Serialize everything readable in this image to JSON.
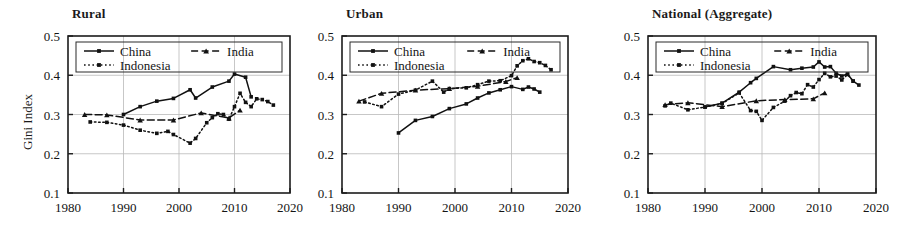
{
  "figure": {
    "ylabel": "Gini Index",
    "panels": [
      "Rural",
      "Urban",
      "National (Aggregate)"
    ]
  },
  "chart_data": [
    {
      "type": "line",
      "title": "Rural",
      "xlabel": "",
      "ylabel": "Gini Index",
      "xlim": [
        1980,
        2020
      ],
      "ylim": [
        0.1,
        0.5
      ],
      "xticks": [
        1980,
        1990,
        2000,
        2010,
        2020
      ],
      "yticks": [
        0.1,
        0.2,
        0.3,
        0.4,
        0.5
      ],
      "grid": true,
      "legend_position": "top-left",
      "series": [
        {
          "name": "China",
          "style": "solid",
          "marker": "square",
          "x": [
            1990,
            1993,
            1996,
            1999,
            2002,
            2003,
            2006,
            2009,
            2010,
            2012,
            2013
          ],
          "y": [
            0.3,
            0.32,
            0.334,
            0.341,
            0.363,
            0.342,
            0.37,
            0.385,
            0.403,
            0.395,
            0.345
          ]
        },
        {
          "name": "India",
          "style": "dashed",
          "marker": "triangle",
          "x": [
            1983,
            1987,
            1993,
            1999,
            2004,
            2009,
            2011
          ],
          "y": [
            0.3,
            0.299,
            0.286,
            0.286,
            0.304,
            0.291,
            0.311
          ]
        },
        {
          "name": "Indonesia",
          "style": "dotted",
          "marker": "square",
          "x": [
            1984,
            1987,
            1990,
            1993,
            1996,
            1998,
            1999,
            2002,
            2003,
            2005,
            2006,
            2007,
            2008,
            2009,
            2010,
            2011,
            2012,
            2013,
            2014,
            2015,
            2016,
            2017
          ],
          "y": [
            0.281,
            0.28,
            0.273,
            0.26,
            0.252,
            0.257,
            0.249,
            0.227,
            0.239,
            0.279,
            0.292,
            0.302,
            0.3,
            0.288,
            0.32,
            0.354,
            0.331,
            0.32,
            0.34,
            0.338,
            0.333,
            0.324
          ]
        }
      ]
    },
    {
      "type": "line",
      "title": "Urban",
      "xlabel": "",
      "ylabel": "",
      "xlim": [
        1980,
        2020
      ],
      "ylim": [
        0.1,
        0.5
      ],
      "xticks": [
        1980,
        1990,
        2000,
        2010,
        2020
      ],
      "yticks": [
        0.1,
        0.2,
        0.3,
        0.4,
        0.5
      ],
      "grid": true,
      "legend_position": "top-left",
      "series": [
        {
          "name": "China",
          "style": "solid",
          "marker": "square",
          "x": [
            1990,
            1993,
            1996,
            1999,
            2002,
            2004,
            2006,
            2008,
            2010,
            2012,
            2013,
            2014,
            2015
          ],
          "y": [
            0.253,
            0.285,
            0.295,
            0.315,
            0.327,
            0.342,
            0.355,
            0.363,
            0.371,
            0.364,
            0.37,
            0.365,
            0.357
          ]
        },
        {
          "name": "India",
          "style": "dashed",
          "marker": "triangle",
          "x": [
            1983,
            1987,
            1993,
            1999,
            2004,
            2009,
            2011
          ],
          "y": [
            0.334,
            0.354,
            0.362,
            0.366,
            0.372,
            0.384,
            0.394
          ]
        },
        {
          "name": "Indonesia",
          "style": "dotted",
          "marker": "square",
          "x": [
            1984,
            1987,
            1990,
            1993,
            1996,
            1998,
            1999,
            2002,
            2004,
            2006,
            2008,
            2010,
            2011,
            2012,
            2013,
            2014,
            2015,
            2016,
            2017
          ],
          "y": [
            0.332,
            0.32,
            0.352,
            0.362,
            0.385,
            0.357,
            0.366,
            0.368,
            0.376,
            0.385,
            0.386,
            0.399,
            0.424,
            0.437,
            0.442,
            0.435,
            0.432,
            0.425,
            0.414
          ]
        }
      ]
    },
    {
      "type": "line",
      "title": "National (Aggregate)",
      "xlabel": "",
      "ylabel": "",
      "xlim": [
        1980,
        2020
      ],
      "ylim": [
        0.1,
        0.5
      ],
      "xticks": [
        1980,
        1990,
        2000,
        2010,
        2020
      ],
      "yticks": [
        0.1,
        0.2,
        0.3,
        0.4,
        0.5
      ],
      "grid": true,
      "legend_position": "top-left",
      "series": [
        {
          "name": "China",
          "style": "solid",
          "marker": "square",
          "x": [
            1990,
            1993,
            1996,
            1998,
            1999,
            2002,
            2005,
            2007,
            2009,
            2010,
            2011,
            2012,
            2013,
            2014,
            2015,
            2016,
            2017
          ],
          "y": [
            0.319,
            0.329,
            0.357,
            0.381,
            0.392,
            0.422,
            0.414,
            0.418,
            0.421,
            0.434,
            0.421,
            0.422,
            0.405,
            0.398,
            0.403,
            0.385,
            0.375
          ]
        },
        {
          "name": "India",
          "style": "dashed",
          "marker": "triangle",
          "x": [
            1983,
            1987,
            1993,
            1999,
            2004,
            2009,
            2011
          ],
          "y": [
            0.325,
            0.33,
            0.32,
            0.335,
            0.338,
            0.34,
            0.355
          ]
        },
        {
          "name": "Indonesia",
          "style": "dotted",
          "marker": "square",
          "x": [
            1983,
            1984,
            1987,
            1990,
            1993,
            1996,
            1998,
            1999,
            2000,
            2002,
            2004,
            2005,
            2006,
            2007,
            2008,
            2009,
            2010,
            2011,
            2012,
            2013,
            2014,
            2015,
            2016
          ],
          "y": [
            0.322,
            0.329,
            0.312,
            0.319,
            0.328,
            0.355,
            0.31,
            0.308,
            0.285,
            0.318,
            0.334,
            0.348,
            0.356,
            0.353,
            0.376,
            0.37,
            0.389,
            0.405,
            0.396,
            0.398,
            0.388,
            0.402,
            0.385
          ]
        }
      ]
    }
  ],
  "panel_layout": [
    {
      "key": "rural",
      "title": "Rural",
      "origin_x": 0,
      "plot_left": 68,
      "plot_top": 36,
      "plot_right": 290,
      "plot_bottom": 193,
      "title_x": 72,
      "title_y": 6,
      "show_ylabel": true
    },
    {
      "key": "urban",
      "title": "Urban",
      "origin_x": 0,
      "plot_left": 342,
      "plot_top": 36,
      "plot_right": 568,
      "plot_bottom": 193,
      "title_x": 346,
      "title_y": 6,
      "show_ylabel": false
    },
    {
      "key": "national",
      "title": "National (Aggregate)",
      "origin_x": 0,
      "plot_left": 648,
      "plot_top": 36,
      "plot_right": 876,
      "plot_bottom": 193,
      "title_x": 652,
      "title_y": 6,
      "show_ylabel": false
    }
  ],
  "legend": {
    "entries": [
      {
        "name": "China",
        "style": "solid",
        "marker": "square"
      },
      {
        "name": "India",
        "style": "dashed",
        "marker": "triangle"
      },
      {
        "name": "Indonesia",
        "style": "dotted",
        "marker": "square"
      }
    ]
  },
  "colors": {
    "ink": "#111111",
    "grid": "#b9b9b9",
    "frame": "#1c1c1c",
    "background": "#ffffff"
  }
}
